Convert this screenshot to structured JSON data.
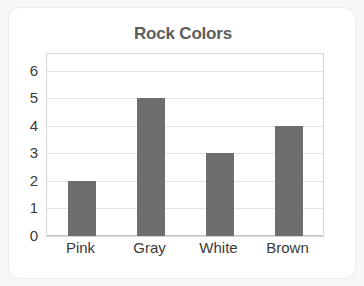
{
  "card": {
    "background_color": "#ffffff",
    "border_color": "#eceaea"
  },
  "chart_data": {
    "type": "bar",
    "title": "Rock Colors",
    "xlabel": "",
    "ylabel": "",
    "categories": [
      "Pink",
      "Gray",
      "White",
      "Brown"
    ],
    "values": [
      2,
      5,
      3,
      4
    ],
    "series": [
      {
        "name": "Rock Colors",
        "values": [
          2,
          5,
          3,
          4
        ]
      }
    ],
    "ylim": [
      0,
      6.6
    ],
    "yticks": [
      0,
      1,
      2,
      3,
      4,
      5,
      6
    ],
    "ytick_labels": [
      "0",
      "1",
      "2",
      "3",
      "4",
      "5",
      "6"
    ],
    "grid": true,
    "grid_axis": "y",
    "legend": false,
    "bar_color": "#6e6e6e",
    "grid_color": "#e3e3e3",
    "axis_color": "#c9c9c9",
    "title_color": "#5c5c5c",
    "tick_label_color": "#3a3a3a"
  }
}
